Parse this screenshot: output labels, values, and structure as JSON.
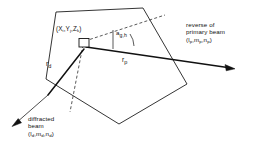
{
  "figure": {
    "background_color": "#ffffff",
    "line_color": "#111111"
  },
  "labels": {
    "point_coordinates": {
      "open_paren": "(",
      "x_symbol": "X",
      "x_sub": "i",
      "comma1": ",",
      "y_symbol": "Y",
      "y_sub": "j",
      "comma2": ",",
      "z_symbol": "Z",
      "z_sub": "k",
      "close_paren": ")"
    },
    "angle": {
      "symbol": "a",
      "subscript": "g,h"
    },
    "r_diffracted": {
      "symbol": "r",
      "subscript": "d"
    },
    "r_primary": {
      "symbol": "r",
      "subscript": "p"
    },
    "primary_beam": {
      "line1": "reverse of",
      "line2": "primary beam",
      "direction_cosines": {
        "open_paren": "(",
        "l_symbol": "l",
        "l_sub": "p",
        "comma1": ",",
        "m_symbol": "m",
        "m_sub": "p",
        "comma2": ",",
        "n_symbol": "n",
        "n_sub": "p",
        "close_paren": ")"
      }
    },
    "diffracted_beam": {
      "line1": "diffracted",
      "line2": "beam",
      "direction_cosines": {
        "open_paren": "(",
        "l_symbol": "l",
        "l_sub": "d",
        "comma1": ",",
        "m_symbol": "m",
        "m_sub": "d",
        "comma2": ",",
        "n_symbol": "n",
        "n_sub": "d",
        "close_paren": ")"
      }
    }
  }
}
